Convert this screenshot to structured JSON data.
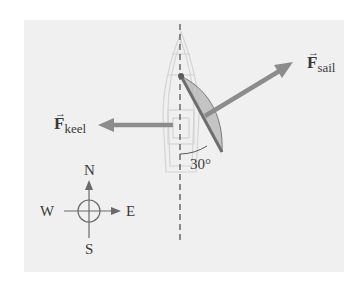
{
  "figure": {
    "background_color": "#f0f0f0",
    "vector_color": "#8c8c8c",
    "text_color": "#3a3a3a"
  },
  "labels": {
    "sail_force": {
      "symbol": "F",
      "subscript": "sail",
      "arrow": "→"
    },
    "keel_force": {
      "symbol": "F",
      "subscript": "keel",
      "arrow": "→"
    },
    "angle": "30°"
  },
  "compass": {
    "north": "N",
    "south": "S",
    "east": "E",
    "west": "W"
  }
}
